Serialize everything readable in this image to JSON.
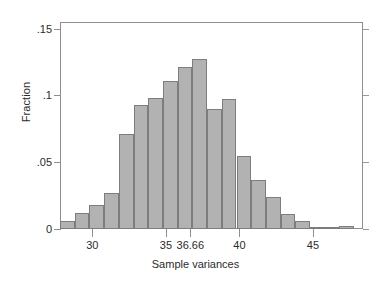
{
  "chart_data": {
    "type": "bar",
    "title": "",
    "subtitle": "",
    "xlabel": "Sample variances",
    "ylabel": "Fraction",
    "xlim": [
      27.8,
      48.4
    ],
    "ylim": [
      0,
      0.155
    ],
    "grid": false,
    "legend": null,
    "legend_position": "none",
    "bar_fill_color": "#b2b2b2",
    "bar_edge_color": "#7d7d7d",
    "axis_color": "#8e8e8e",
    "background_color": "#ffffff",
    "x_tick_labels": [
      "30",
      "35",
      "36.66",
      "40",
      "45"
    ],
    "x_tick_values": [
      30,
      35,
      36.66,
      40,
      45
    ],
    "y_tick_labels": [
      "0",
      ".05",
      ".1",
      ".15"
    ],
    "y_tick_values": [
      0,
      0.05,
      0.1,
      0.15
    ],
    "bin_width": 1,
    "bin_centers": [
      28.3,
      29.3,
      30.3,
      31.3,
      32.3,
      33.3,
      34.3,
      35.3,
      36.3,
      37.3,
      38.3,
      39.3,
      40.3,
      41.3,
      42.3,
      43.3,
      44.3,
      45.3,
      46.3,
      47.3
    ],
    "categories": [
      "28.3",
      "29.3",
      "30.3",
      "31.3",
      "32.3",
      "33.3",
      "34.3",
      "35.3",
      "36.3",
      "37.3",
      "38.3",
      "39.3",
      "40.3",
      "41.3",
      "42.3",
      "43.3",
      "44.3",
      "45.3",
      "46.3",
      "47.3"
    ],
    "values": [
      0.006,
      0.012,
      0.018,
      0.027,
      0.071,
      0.093,
      0.098,
      0.111,
      0.121,
      0.127,
      0.09,
      0.097,
      0.055,
      0.037,
      0.024,
      0.011,
      0.006,
      0.001,
      0.0,
      0.002
    ]
  },
  "axes": {
    "y_title": "Fraction",
    "x_title": "Sample variances"
  }
}
